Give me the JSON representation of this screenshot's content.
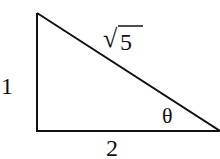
{
  "diagram": {
    "type": "right-triangle",
    "vertices": {
      "top_left": [
        37,
        13
      ],
      "bottom_left": [
        37,
        131
      ],
      "bottom_right": [
        220,
        131
      ]
    },
    "labels": {
      "vertical_leg": "1",
      "horizontal_leg": "2",
      "hypotenuse_radical": "√",
      "hypotenuse_value": "5",
      "angle": "θ"
    },
    "stroke_color": "#111111"
  }
}
